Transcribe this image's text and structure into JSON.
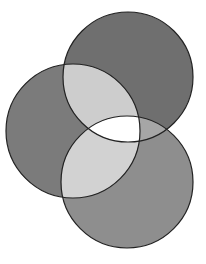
{
  "diagram": {
    "type": "venn",
    "set_count": 3,
    "background": "#ffffff",
    "stroke": "#222222",
    "circles": [
      {
        "id": "top",
        "cx": 128,
        "cy": 77,
        "r": 65,
        "fill": "#6f6f6f"
      },
      {
        "id": "left",
        "cx": 73,
        "cy": 131,
        "r": 67,
        "fill": "#7b7b7b"
      },
      {
        "id": "bottom",
        "cx": 127,
        "cy": 182,
        "r": 66,
        "fill": "#8e8e8e"
      }
    ],
    "regions": {
      "top_left": "#cdcdcd",
      "left_bottom": "#d2d2d2",
      "top_bottom": "#a6a6a6",
      "all_three": "#ffffff"
    }
  }
}
